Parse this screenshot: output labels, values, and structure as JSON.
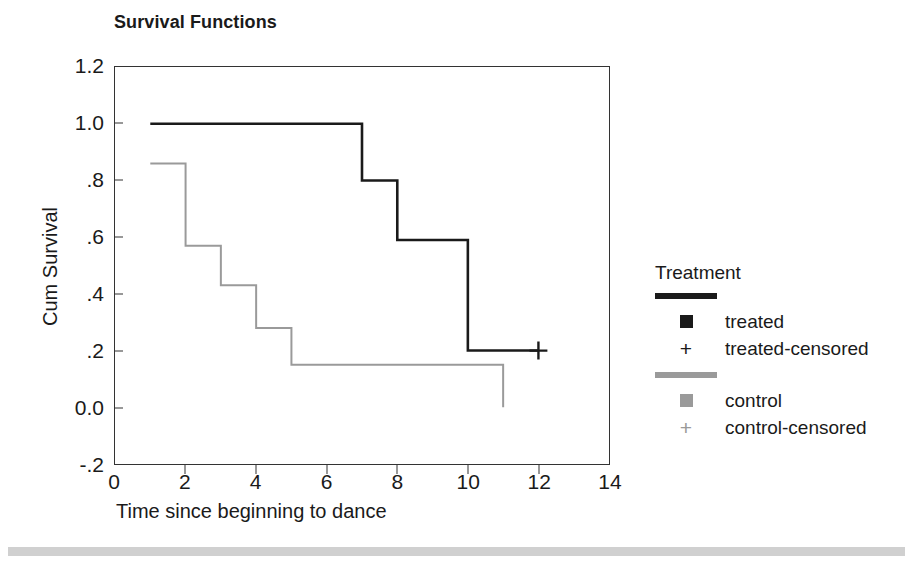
{
  "title": "Survival Functions",
  "axes": {
    "xlabel": "Time since beginning to dance",
    "ylabel": "Cum Survival",
    "xticks": [
      "0",
      "2",
      "4",
      "6",
      "8",
      "10",
      "12",
      "14"
    ],
    "yticks": [
      "1.2",
      "1.0",
      ".8",
      ".6",
      ".4",
      ".2",
      "0.0",
      "-.2"
    ]
  },
  "legend": {
    "title": "Treatment",
    "entries": [
      {
        "label": "treated",
        "censored_label": "treated-censored",
        "color": "#1a1a1a",
        "censor_glyph": "+"
      },
      {
        "label": "control",
        "censored_label": "control-censored",
        "color": "#9a9a9a",
        "censor_glyph": "+"
      }
    ]
  },
  "colors": {
    "treated": "#1a1a1a",
    "control": "#9a9a9a",
    "frame": "#333333",
    "band": "#d0d0d0"
  },
  "chart_data": {
    "type": "line",
    "title": "Survival Functions",
    "xlabel": "Time since beginning to dance",
    "ylabel": "Cum Survival",
    "xlim": [
      0,
      14
    ],
    "ylim": [
      -0.2,
      1.2
    ],
    "xticks": [
      0,
      2,
      4,
      6,
      8,
      10,
      12,
      14
    ],
    "yticks": [
      -0.2,
      0.0,
      0.2,
      0.4,
      0.6,
      0.8,
      1.0,
      1.2
    ],
    "grid": false,
    "legend_position": "right",
    "step": "post",
    "series": [
      {
        "name": "treated",
        "color": "#1a1a1a",
        "x": [
          1,
          7,
          8,
          10,
          12
        ],
        "y": [
          1.0,
          0.8,
          0.59,
          0.2,
          0.2
        ],
        "censored_points": [
          {
            "x": 12,
            "y": 0.2
          }
        ]
      },
      {
        "name": "control",
        "color": "#9a9a9a",
        "x": [
          1,
          2,
          3,
          4,
          5,
          11
        ],
        "y": [
          0.86,
          0.57,
          0.43,
          0.28,
          0.15,
          0.0
        ],
        "censored_points": []
      }
    ]
  }
}
